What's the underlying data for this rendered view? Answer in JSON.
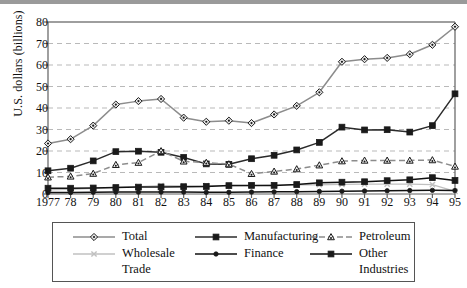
{
  "chart_data": {
    "type": "line",
    "title": "",
    "xlabel": "",
    "ylabel": "U.S. dollars (billions)",
    "x": [
      1977,
      1978,
      1979,
      1980,
      1981,
      1982,
      1983,
      1984,
      1985,
      1986,
      1987,
      1988,
      1989,
      1990,
      1991,
      1992,
      1993,
      1994,
      1995
    ],
    "xtick_labels": [
      "1977",
      "78",
      "79",
      "80",
      "81",
      "82",
      "83",
      "84",
      "85",
      "86",
      "87",
      "88",
      "89",
      "90",
      "91",
      "92",
      "93",
      "94",
      "95"
    ],
    "ylim": [
      0,
      80
    ],
    "yticks": [
      0,
      10,
      20,
      30,
      40,
      50,
      60,
      70,
      80
    ],
    "ytick_labels": [
      "0",
      "10",
      "20",
      "30",
      "40",
      "50",
      "60",
      "70",
      "80"
    ],
    "grid": "horizontal-dashed",
    "legend_position": "below-plot",
    "series": [
      {
        "name": "Total",
        "marker": "diamond",
        "color": "#8c8c8c",
        "dash": "solid",
        "values": [
          23.5,
          25.5,
          31.8,
          41.6,
          43.2,
          44.2,
          35.5,
          33.6,
          34.1,
          33.0,
          37.0,
          41.0,
          47.3,
          61.5,
          62.7,
          63.3,
          65.0,
          69.4,
          77.8
        ]
      },
      {
        "name": "Manufacturing",
        "marker": "square",
        "color": "#2b2b2b",
        "dash": "solid",
        "values": [
          10.8,
          12.0,
          15.4,
          19.7,
          19.9,
          19.4,
          17.0,
          14.0,
          13.8,
          16.4,
          18.0,
          20.5,
          24.0,
          31.1,
          29.8,
          29.9,
          28.8,
          31.8,
          46.6
        ]
      },
      {
        "name": "Petroleum",
        "marker": "triangle",
        "color": "#8c8c8c",
        "dash": "dashed",
        "values": [
          7.8,
          8.2,
          9.5,
          13.6,
          14.6,
          20.0,
          15.2,
          14.6,
          13.9,
          9.4,
          10.5,
          11.6,
          13.4,
          15.3,
          15.6,
          15.6,
          15.6,
          15.8,
          12.8
        ]
      },
      {
        "name": "Wholesale Trade",
        "marker": "x",
        "color": "#c0c0c0",
        "dash": "solid",
        "values": [
          1.9,
          2.2,
          2.6,
          3.1,
          3.4,
          3.9,
          3.8,
          3.9,
          3.8,
          3.9,
          4.1,
          4.2,
          4.3,
          4.5,
          4.6,
          4.6,
          4.6,
          4.4,
          1.2
        ]
      },
      {
        "name": "Finance",
        "marker": "circle",
        "color": "#111111",
        "dash": "solid",
        "values": [
          0.7,
          0.7,
          0.8,
          0.9,
          0.9,
          0.9,
          0.9,
          0.8,
          0.8,
          0.9,
          1.0,
          1.1,
          1.2,
          1.3,
          1.4,
          1.5,
          1.6,
          1.7,
          1.6
        ]
      },
      {
        "name": "Other Industries",
        "marker": "square",
        "color": "#111111",
        "dash": "solid",
        "values": [
          2.7,
          2.7,
          2.8,
          3.0,
          3.2,
          3.3,
          3.4,
          3.5,
          3.9,
          4.0,
          4.0,
          4.4,
          5.2,
          5.5,
          5.7,
          6.2,
          6.6,
          7.6,
          6.3
        ]
      }
    ]
  },
  "legend": {
    "items": [
      {
        "label": "Total",
        "cont": ""
      },
      {
        "label": "Wholesale",
        "cont": "Trade"
      },
      {
        "label": "Manufacturing",
        "cont": ""
      },
      {
        "label": "Finance",
        "cont": ""
      },
      {
        "label": "Petroleum",
        "cont": ""
      },
      {
        "label": "Other",
        "cont": "Industries"
      }
    ]
  }
}
